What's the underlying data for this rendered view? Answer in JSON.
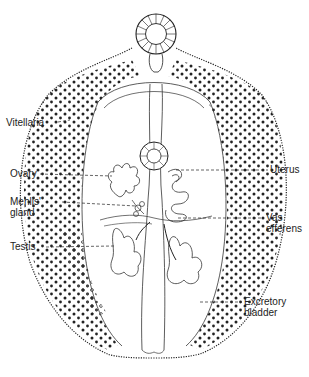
{
  "diagram": {
    "colors": {
      "ink": "#222222",
      "background": "#ffffff"
    },
    "labels": {
      "vitellaria": "Vitellaria",
      "ovary": "Ovary",
      "mehlis_line1": "Mehlis'",
      "mehlis_line2": "gland",
      "testis": "Testis",
      "uterus": "Uterus",
      "vas_line1": "Vas",
      "vas_line2": "efferens",
      "excretory_line1": "Excretory",
      "excretory_line2": "bladder"
    }
  }
}
